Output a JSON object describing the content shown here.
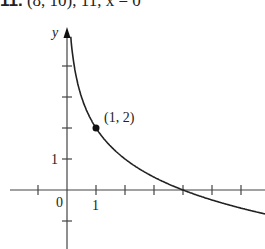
{
  "header": {
    "number": "11.",
    "text": "(8, 10), 11, x = 0"
  },
  "chart_data": {
    "type": "line",
    "title": "",
    "xlabel": "",
    "ylabel": "y",
    "xlim": [
      -1,
      6.5
    ],
    "ylim": [
      -2,
      4.5
    ],
    "x_tick_labels": [
      {
        "value": 0,
        "label": "0"
      },
      {
        "value": 1,
        "label": "1"
      }
    ],
    "y_tick_labels": [
      {
        "value": 1,
        "label": "1"
      }
    ],
    "x_ticks": [
      -1,
      1,
      2,
      3,
      4,
      5,
      6
    ],
    "y_ticks": [
      -1,
      1,
      2,
      3,
      4
    ],
    "series": [
      {
        "name": "y = 2 - log2(x)",
        "x": [
          0.15,
          0.25,
          0.5,
          1,
          2,
          3,
          4,
          5,
          6,
          6.8
        ],
        "y": [
          4.74,
          4,
          3,
          2,
          1,
          0.415,
          0,
          -0.32,
          -0.585,
          -0.77
        ]
      }
    ],
    "annotations": [
      {
        "x": 1,
        "y": 2,
        "label": "(1, 2)",
        "marker": "dot"
      }
    ],
    "grid": false
  }
}
